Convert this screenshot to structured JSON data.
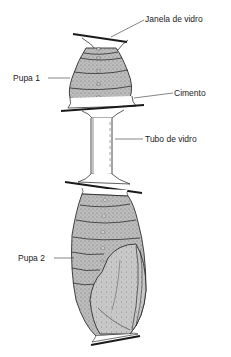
{
  "diagram": {
    "title": "",
    "labels": {
      "glass_window": "Janela de vidro",
      "pupa_1": "Pupa 1",
      "cement": "Cimento",
      "glass_tube": "Tubo de vidro",
      "pupa_2": "Pupa 2"
    },
    "colors": {
      "ink": "#1a1a1a",
      "stipple": "#9a9a9a",
      "pupa_fill": "#b8b8b8",
      "wing_fill": "#c4c4c4",
      "glass": "#ffffff"
    }
  }
}
